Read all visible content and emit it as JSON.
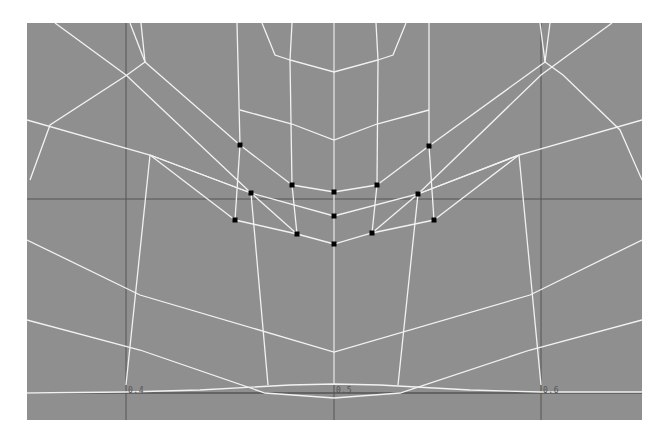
{
  "viewport": {
    "name": "3D modeling viewport (front orthographic, wireframe)",
    "background": "#8f8f8f",
    "wire_color": "#f2f2f2",
    "grid_color": "#555555",
    "vertex_color": "#000000"
  },
  "axis_labels": [
    {
      "text": "0.4",
      "x": 128,
      "y": 392
    },
    {
      "text": "0.5",
      "x": 336,
      "y": 392
    },
    {
      "text": "0.6",
      "x": 543,
      "y": 392
    }
  ],
  "grid": {
    "vertical_x": [
      126,
      334,
      541
    ],
    "horizontal_y": [
      199,
      393
    ]
  },
  "selected_vertices": [
    [
      240,
      145
    ],
    [
      429,
      146
    ],
    [
      292,
      185
    ],
    [
      334,
      192
    ],
    [
      377,
      185
    ],
    [
      251,
      193
    ],
    [
      418,
      194
    ],
    [
      334,
      216
    ],
    [
      235,
      220
    ],
    [
      434,
      220
    ],
    [
      297,
      234
    ],
    [
      372,
      233
    ],
    [
      334,
      244
    ]
  ],
  "wire_edges": [
    [
      [
        334,
        23
      ],
      [
        334,
        385
      ]
    ],
    [
      [
        292,
        23
      ],
      [
        290,
        60
      ],
      [
        334,
        72
      ],
      [
        378,
        60
      ],
      [
        376,
        23
      ]
    ],
    [
      [
        262,
        23
      ],
      [
        275,
        55
      ],
      [
        290,
        60
      ]
    ],
    [
      [
        406,
        23
      ],
      [
        393,
        55
      ],
      [
        378,
        60
      ]
    ],
    [
      [
        290,
        60
      ],
      [
        292,
        185
      ]
    ],
    [
      [
        378,
        60
      ],
      [
        377,
        185
      ]
    ],
    [
      [
        237,
        23
      ],
      [
        240,
        145
      ]
    ],
    [
      [
        429,
        23
      ],
      [
        429,
        146
      ]
    ],
    [
      [
        240,
        110
      ],
      [
        292,
        124
      ],
      [
        334,
        140
      ],
      [
        377,
        124
      ],
      [
        429,
        110
      ]
    ],
    [
      [
        240,
        145
      ],
      [
        292,
        185
      ]
    ],
    [
      [
        429,
        146
      ],
      [
        377,
        185
      ]
    ],
    [
      [
        292,
        185
      ],
      [
        334,
        192
      ],
      [
        377,
        185
      ]
    ],
    [
      [
        240,
        145
      ],
      [
        235,
        220
      ]
    ],
    [
      [
        429,
        146
      ],
      [
        434,
        220
      ]
    ],
    [
      [
        141,
        23
      ],
      [
        145,
        62
      ],
      [
        127,
        75
      ],
      [
        50,
        125
      ],
      [
        30,
        180
      ]
    ],
    [
      [
        145,
        62
      ],
      [
        240,
        145
      ]
    ],
    [
      [
        130,
        23
      ],
      [
        145,
        62
      ]
    ],
    [
      [
        550,
        23
      ],
      [
        545,
        62
      ],
      [
        563,
        75
      ],
      [
        620,
        130
      ],
      [
        642,
        180
      ]
    ],
    [
      [
        545,
        62
      ],
      [
        429,
        146
      ]
    ],
    [
      [
        540,
        23
      ],
      [
        545,
        62
      ]
    ],
    [
      [
        55,
        23
      ],
      [
        126,
        75
      ],
      [
        251,
        193
      ]
    ],
    [
      [
        612,
        23
      ],
      [
        541,
        75
      ],
      [
        418,
        194
      ]
    ],
    [
      [
        27,
        120
      ],
      [
        150,
        155
      ],
      [
        251,
        193
      ],
      [
        334,
        216
      ],
      [
        418,
        194
      ],
      [
        519,
        155
      ],
      [
        642,
        120
      ]
    ],
    [
      [
        150,
        155
      ],
      [
        235,
        220
      ]
    ],
    [
      [
        150,
        155
      ],
      [
        251,
        193
      ]
    ],
    [
      [
        519,
        155
      ],
      [
        434,
        220
      ]
    ],
    [
      [
        519,
        155
      ],
      [
        418,
        194
      ]
    ],
    [
      [
        150,
        155
      ],
      [
        126,
        385
      ]
    ],
    [
      [
        519,
        155
      ],
      [
        541,
        385
      ]
    ],
    [
      [
        251,
        193
      ],
      [
        297,
        234
      ]
    ],
    [
      [
        251,
        193
      ],
      [
        268,
        385
      ]
    ],
    [
      [
        418,
        194
      ],
      [
        372,
        233
      ]
    ],
    [
      [
        418,
        194
      ],
      [
        398,
        385
      ]
    ],
    [
      [
        235,
        220
      ],
      [
        297,
        234
      ],
      [
        334,
        244
      ],
      [
        372,
        233
      ],
      [
        434,
        220
      ]
    ],
    [
      [
        292,
        185
      ],
      [
        297,
        234
      ]
    ],
    [
      [
        377,
        185
      ],
      [
        372,
        233
      ]
    ],
    [
      [
        27,
        240
      ],
      [
        140,
        295
      ],
      [
        334,
        352
      ],
      [
        530,
        295
      ],
      [
        642,
        240
      ]
    ],
    [
      [
        27,
        320
      ],
      [
        140,
        350
      ],
      [
        265,
        393
      ],
      [
        334,
        398
      ],
      [
        400,
        393
      ],
      [
        530,
        350
      ],
      [
        642,
        320
      ]
    ],
    [
      [
        27,
        393
      ],
      [
        126,
        392
      ],
      [
        200,
        390
      ],
      [
        290,
        385
      ],
      [
        334,
        384
      ],
      [
        380,
        385
      ],
      [
        470,
        390
      ],
      [
        541,
        392
      ],
      [
        642,
        392
      ]
    ]
  ]
}
